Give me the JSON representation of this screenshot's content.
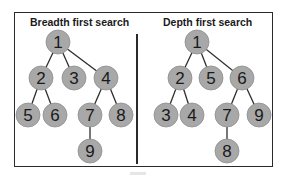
{
  "panels": [
    {
      "title": "Breadth first search",
      "title_x": 30,
      "nodes": [
        {
          "label": "1",
          "x": 58,
          "y": 42
        },
        {
          "label": "2",
          "x": 41,
          "y": 78
        },
        {
          "label": "3",
          "x": 74,
          "y": 78
        },
        {
          "label": "4",
          "x": 106,
          "y": 78
        },
        {
          "label": "5",
          "x": 28,
          "y": 115
        },
        {
          "label": "6",
          "x": 55,
          "y": 115
        },
        {
          "label": "7",
          "x": 90,
          "y": 115
        },
        {
          "label": "8",
          "x": 121,
          "y": 115
        },
        {
          "label": "9",
          "x": 90,
          "y": 151
        }
      ],
      "edges": [
        [
          "1",
          "2"
        ],
        [
          "1",
          "3"
        ],
        [
          "1",
          "4"
        ],
        [
          "2",
          "5"
        ],
        [
          "2",
          "6"
        ],
        [
          "4",
          "7"
        ],
        [
          "4",
          "8"
        ],
        [
          "7",
          "9"
        ]
      ]
    },
    {
      "title": "Depth first search",
      "title_x": 163,
      "nodes": [
        {
          "label": "1",
          "x": 197,
          "y": 42
        },
        {
          "label": "2",
          "x": 180,
          "y": 78
        },
        {
          "label": "5",
          "x": 211,
          "y": 78
        },
        {
          "label": "6",
          "x": 242,
          "y": 78
        },
        {
          "label": "3",
          "x": 166,
          "y": 115
        },
        {
          "label": "4",
          "x": 192,
          "y": 115
        },
        {
          "label": "7",
          "x": 227,
          "y": 115
        },
        {
          "label": "9",
          "x": 259,
          "y": 115
        },
        {
          "label": "8",
          "x": 227,
          "y": 151
        }
      ],
      "edges": [
        [
          "1",
          "2"
        ],
        [
          "1",
          "5"
        ],
        [
          "1",
          "6"
        ],
        [
          "2",
          "3"
        ],
        [
          "2",
          "4"
        ],
        [
          "6",
          "7"
        ],
        [
          "6",
          "9"
        ],
        [
          "7",
          "8"
        ]
      ]
    }
  ],
  "style": {
    "node_fill": "#a8a8a8",
    "node_stroke": "#8e8e8e",
    "edge_color": "#2e2e2e",
    "label_color": "#1a1a1a",
    "node_radius": 12
  }
}
